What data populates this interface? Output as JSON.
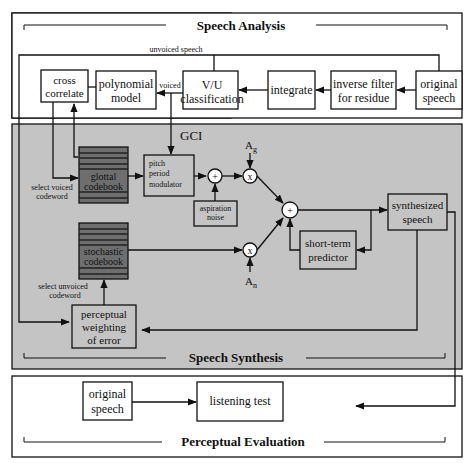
{
  "panels": {
    "analysis": {
      "title": "Speech Analysis"
    },
    "synthesis": {
      "title": "Speech Synthesis"
    },
    "evaluation": {
      "title": "Perceptual Evaluation"
    }
  },
  "colors": {
    "synthesis_bg": "#c4c4c4",
    "codebook_fill": "#6e6e6e",
    "box_fill": "#ffffff",
    "line": "#111111"
  },
  "analysis_blocks": {
    "cross_correlate": [
      "cross",
      "correlate"
    ],
    "polynomial_model": [
      "polynomial",
      "model"
    ],
    "vu_classification": [
      "V/U",
      "classification"
    ],
    "integrate": [
      "integrate"
    ],
    "inverse_filter": [
      "inverse filter",
      "for residue"
    ],
    "original_speech": [
      "original",
      "speech"
    ]
  },
  "analysis_labels": {
    "unvoiced_speech": "unvoiced speech",
    "voiced": "voiced"
  },
  "synthesis_blocks": {
    "glottal_codebook": [
      "glottal",
      "codebook"
    ],
    "stochastic_codebook": [
      "stochastic",
      "codebook"
    ],
    "pitch_period_modulator": [
      "pitch",
      "period",
      "modulator"
    ],
    "aspiration_noise": [
      "aspiration",
      "noise"
    ],
    "short_term_predictor": [
      "short-term",
      "predictor"
    ],
    "synthesized_speech": [
      "synthesized",
      "speech"
    ],
    "perceptual_weighting": [
      "perceptual",
      "weighting",
      "of error"
    ]
  },
  "synthesis_labels": {
    "gci": "GCI",
    "select_voiced": [
      "select voiced",
      "codeword"
    ],
    "select_unvoiced": [
      "select unvoiced",
      "codeword"
    ],
    "gain_glottal": "A",
    "gain_glottal_sub": "g",
    "gain_noise": "A",
    "gain_noise_sub": "n",
    "sum_symbol": "+",
    "mult_symbol": "x"
  },
  "evaluation_blocks": {
    "original_speech": [
      "original",
      "speech"
    ],
    "listening_test": [
      "listening test"
    ]
  }
}
